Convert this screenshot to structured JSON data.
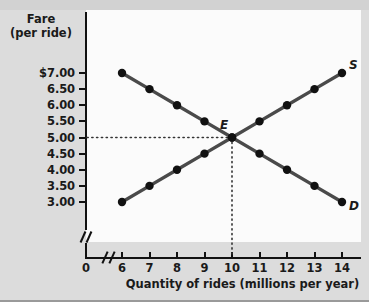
{
  "chart_data": {
    "type": "line",
    "title": "",
    "ylabel_line1": "Fare",
    "ylabel_line2": "(per ride)",
    "xlabel": "Quantity of rides (millions per year)",
    "x": [
      6,
      7,
      8,
      9,
      10,
      11,
      12,
      13,
      14
    ],
    "xlim": [
      6,
      14
    ],
    "ylim": [
      3.0,
      7.0
    ],
    "x_tick_labels": [
      "6",
      "7",
      "8",
      "9",
      "10",
      "11",
      "12",
      "13",
      "14"
    ],
    "y_tick_labels": [
      "3.00",
      "3.50",
      "4.00",
      "4.50",
      "5.00",
      "5.50",
      "6.00",
      "6.50",
      "$7.00"
    ],
    "y_tick_values": [
      3.0,
      3.5,
      4.0,
      4.5,
      5.0,
      5.5,
      6.0,
      6.5,
      7.0
    ],
    "origin_label": "0",
    "axis_break": true,
    "grid": false,
    "legend": "none",
    "series": [
      {
        "name": "D",
        "label": "D",
        "description": "Demand curve",
        "values": [
          7.0,
          6.5,
          6.0,
          5.5,
          5.0,
          4.5,
          4.0,
          3.5,
          3.0
        ],
        "color": "#4a4a4a"
      },
      {
        "name": "S",
        "label": "S",
        "description": "Supply curve",
        "values": [
          3.0,
          3.5,
          4.0,
          4.5,
          5.0,
          5.5,
          6.0,
          6.5,
          7.0
        ],
        "color": "#4a4a4a"
      }
    ],
    "annotations": [
      {
        "name": "equilibrium",
        "label": "E",
        "x": 10,
        "y": 5.0,
        "guide_lines": "dotted to both axes"
      }
    ],
    "colors": {
      "curve": "#4a4a4a",
      "point": "#111111",
      "axis": "#111111",
      "background": "#dcdcdc",
      "plot_background": "#fbfbfb",
      "text": "#1a1a1a"
    }
  }
}
